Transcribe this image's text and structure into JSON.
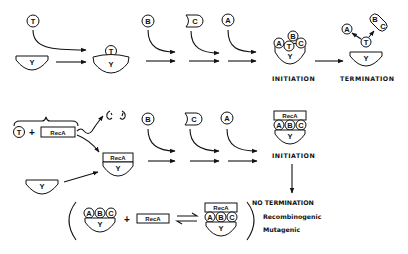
{
  "diagram": {
    "molecules": {
      "T": "T",
      "B": "B",
      "C": "C",
      "A": "A",
      "Y": "Y",
      "RecA": "RecA"
    },
    "top_row": {
      "stage_initiation": "INITIATION",
      "stage_termination": "TERMINATION"
    },
    "bottom_row": {
      "stage_initiation": "INITIATION",
      "outcome_title": "NO TERMINATION",
      "outcome_1": "Recombinogenic",
      "outcome_2": "Mutagenic"
    },
    "equation": {
      "plus": "+",
      "equilibrium": "⇌"
    },
    "colors": {
      "ink": "#111111",
      "background": "#ffffff"
    }
  }
}
